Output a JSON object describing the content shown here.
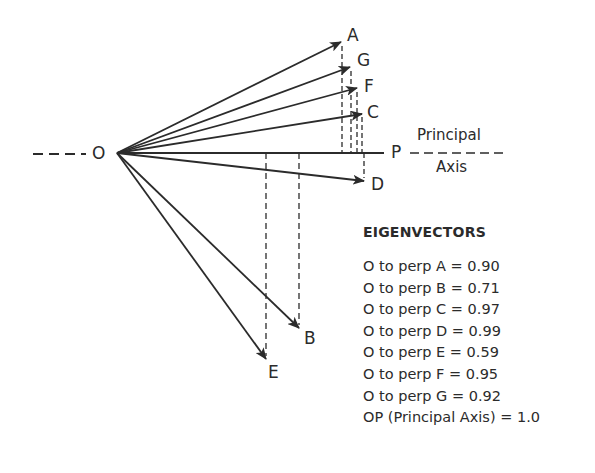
{
  "diagram": {
    "origin_label": "O",
    "axis_end_label": "P",
    "axis_caption_top": "Principal",
    "axis_caption_bottom": "Axis",
    "points": {
      "A": "A",
      "G": "G",
      "F": "F",
      "C": "C",
      "D": "D",
      "B": "B",
      "E": "E"
    },
    "colors": {
      "line": "#2b2b2b",
      "background": "#ffffff"
    }
  },
  "legend": {
    "title": "EIGENVECTORS",
    "rows": [
      "O to perp A  = 0.90",
      "O to perp B  = 0.71",
      "O to perp C = 0.97",
      "O to perp D = 0.99",
      "O to perp E  = 0.59",
      "O to perp F  = 0.95",
      "O to perp G = 0.92",
      "OP (Principal Axis) = 1.0"
    ]
  }
}
